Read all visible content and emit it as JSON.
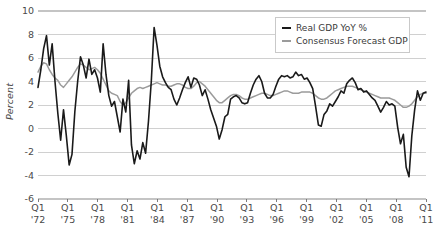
{
  "chart_data": {
    "type": "line",
    "title": "",
    "xlabel": "",
    "ylabel": "Percent",
    "ylim": [
      -6,
      10
    ],
    "yticks": [
      10,
      8,
      6,
      4,
      2,
      0,
      -2,
      -4,
      -6
    ],
    "grid": true,
    "legend_position": "top-right",
    "x_tick_labels": [
      {
        "quarter": "Q1",
        "year": "'72"
      },
      {
        "quarter": "Q1",
        "year": "'75"
      },
      {
        "quarter": "Q1",
        "year": "'78"
      },
      {
        "quarter": "Q1",
        "year": "'81"
      },
      {
        "quarter": "Q1",
        "year": "'84"
      },
      {
        "quarter": "Q1",
        "year": "'87"
      },
      {
        "quarter": "Q1",
        "year": "'90"
      },
      {
        "quarter": "Q1",
        "year": "'93"
      },
      {
        "quarter": "Q1",
        "year": "'96"
      },
      {
        "quarter": "Q1",
        "year": "'99"
      },
      {
        "quarter": "Q1",
        "year": "'02"
      },
      {
        "quarter": "Q1",
        "year": "'05"
      },
      {
        "quarter": "Q1",
        "year": "'08"
      },
      {
        "quarter": "Q1",
        "year": "'11"
      }
    ],
    "x_start_year": 1972,
    "x_end_year": 2011.0,
    "x_step_years": 0.25,
    "series": [
      {
        "name": "Real GDP YoY %",
        "color": "#1a1a1a",
        "width": 1.6,
        "values": [
          3.5,
          5.0,
          6.8,
          7.9,
          5.4,
          7.2,
          4.0,
          1.3,
          -1.0,
          1.6,
          -0.6,
          -3.1,
          -2.2,
          1.4,
          4.0,
          6.1,
          5.4,
          4.3,
          5.9,
          4.6,
          5.0,
          4.3,
          3.1,
          7.2,
          4.6,
          2.8,
          1.9,
          2.3,
          1.0,
          -0.3,
          2.5,
          1.4,
          4.1,
          -1.4,
          -3.0,
          -1.9,
          -2.6,
          -1.2,
          -2.1,
          0.6,
          4.0,
          8.6,
          7.1,
          5.3,
          4.4,
          3.9,
          3.5,
          3.3,
          2.5,
          2.0,
          2.6,
          3.3,
          3.9,
          4.4,
          3.5,
          4.3,
          4.2,
          3.7,
          2.8,
          3.3,
          2.5,
          1.6,
          0.9,
          0.2,
          -0.9,
          -0.1,
          1.0,
          1.2,
          2.5,
          2.7,
          2.8,
          2.6,
          2.2,
          2.1,
          2.2,
          3.0,
          3.7,
          4.2,
          4.5,
          4.0,
          3.0,
          2.6,
          2.6,
          2.9,
          3.6,
          4.2,
          4.5,
          4.4,
          4.5,
          4.3,
          4.4,
          4.8,
          4.5,
          4.6,
          4.2,
          4.3,
          3.9,
          3.4,
          1.9,
          0.3,
          0.2,
          1.2,
          1.5,
          2.1,
          1.9,
          2.3,
          2.7,
          3.2,
          3.0,
          3.8,
          4.1,
          4.3,
          3.9,
          3.3,
          3.4,
          3.1,
          3.2,
          2.9,
          2.6,
          2.4,
          1.9,
          1.4,
          1.8,
          2.3,
          2.0,
          2.1,
          1.9,
          0.1,
          -1.3,
          -0.5,
          -3.3,
          -4.1,
          -0.6,
          1.6,
          3.2,
          2.4,
          3.0,
          3.1
        ]
      },
      {
        "name": "Consensus Forecast GDP",
        "color": "#9b9b9b",
        "width": 1.5,
        "values": [
          4.8,
          5.3,
          5.6,
          5.5,
          5.0,
          4.6,
          4.3,
          4.1,
          3.7,
          3.5,
          3.8,
          4.1,
          4.4,
          4.8,
          5.2,
          5.5,
          5.4,
          5.2,
          5.0,
          5.1,
          5.2,
          5.0,
          4.7,
          4.2,
          3.7,
          3.2,
          3.0,
          2.9,
          2.8,
          2.3,
          2.0,
          2.2,
          2.6,
          3.0,
          3.2,
          3.4,
          3.5,
          3.4,
          3.5,
          3.6,
          3.7,
          3.8,
          3.9,
          3.8,
          3.7,
          3.7,
          3.6,
          3.6,
          3.7,
          3.8,
          3.8,
          3.7,
          3.5,
          3.4,
          3.4,
          3.6,
          3.9,
          4.0,
          3.8,
          3.6,
          3.3,
          3.0,
          2.7,
          2.4,
          2.2,
          2.2,
          2.4,
          2.6,
          2.8,
          2.9,
          2.9,
          2.8,
          2.6,
          2.5,
          2.5,
          2.6,
          2.7,
          2.8,
          2.9,
          3.0,
          3.0,
          2.9,
          2.8,
          2.8,
          2.9,
          3.0,
          3.1,
          3.2,
          3.2,
          3.1,
          3.0,
          3.0,
          3.0,
          3.1,
          3.1,
          3.1,
          3.1,
          3.0,
          2.8,
          2.6,
          2.5,
          2.5,
          2.6,
          2.8,
          3.0,
          3.2,
          3.3,
          3.4,
          3.5,
          3.6,
          3.6,
          3.6,
          3.5,
          3.4,
          3.3,
          3.2,
          3.1,
          3.0,
          2.9,
          2.8,
          2.7,
          2.6,
          2.6,
          2.6,
          2.6,
          2.5,
          2.4,
          2.2,
          2.0,
          1.8,
          1.8,
          1.9,
          2.1,
          2.4,
          2.7,
          2.9,
          3.0,
          3.0
        ]
      }
    ]
  },
  "legend": {
    "items": [
      {
        "label": "Real GDP YoY %",
        "swatch": "black"
      },
      {
        "label": "Consensus Forecast GDP",
        "swatch": "gray"
      }
    ]
  },
  "axes": {
    "y_title": "Percent"
  },
  "colors": {
    "real_gdp": "#1a1a1a",
    "consensus": "#9b9b9b",
    "grid": "#c4c4c4",
    "axis": "#6e6e6e",
    "text": "#4a4a4a"
  }
}
